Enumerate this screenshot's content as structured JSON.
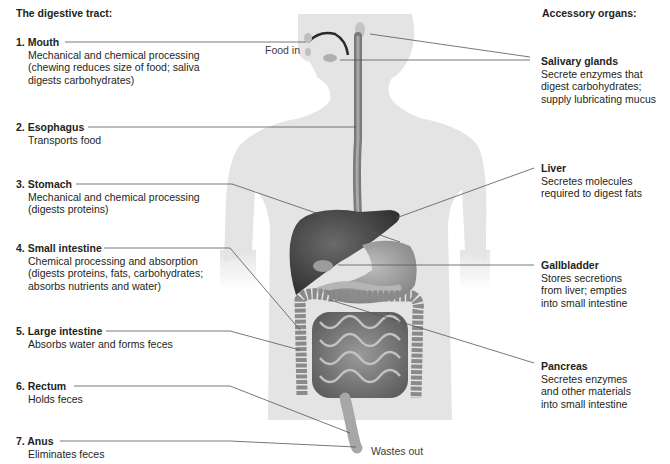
{
  "diagram": {
    "left_heading": "The digestive tract:",
    "right_heading": "Accessory organs:",
    "tract": [
      {
        "number": "1.",
        "name": "Mouth",
        "title": "1. Mouth",
        "description": "Mechanical and chemical processing\n(chewing reduces size of food; saliva\ndigests carbohydrates)"
      },
      {
        "number": "2.",
        "name": "Esophagus",
        "title": "2. Esophagus",
        "description": "Transports food"
      },
      {
        "number": "3.",
        "name": "Stomach",
        "title": "3. Stomach",
        "description": "Mechanical and chemical processing\n(digests proteins)"
      },
      {
        "number": "4.",
        "name": "Small intestine",
        "title": "4. Small intestine",
        "description": "Chemical processing and absorption\n(digests proteins, fats, carbohydrates;\nabsorbs nutrients and water)"
      },
      {
        "number": "5.",
        "name": "Large intestine",
        "title": "5. Large intestine",
        "description": "Absorbs water and forms feces"
      },
      {
        "number": "6.",
        "name": "Rectum",
        "title": "6. Rectum",
        "description": "Holds feces"
      },
      {
        "number": "7.",
        "name": "Anus",
        "title": "7. Anus",
        "description": "Eliminates feces"
      }
    ],
    "accessory": [
      {
        "name": "Salivary glands",
        "description": "Secrete enzymes that\ndigest carbohydrates;\nsupply lubricating mucus"
      },
      {
        "name": "Liver",
        "description": "Secretes molecules\nrequired to digest fats"
      },
      {
        "name": "Gallbladder",
        "description": "Stores secretions\nfrom liver; empties\ninto small intestine"
      },
      {
        "name": "Pancreas",
        "description": "Secretes enzymes\nand other materials\ninto small intestine"
      }
    ],
    "annotations": {
      "food_in": "Food in",
      "wastes_out": "Wastes out"
    },
    "colors": {
      "silhouette": "#e4e4e4",
      "organ_dark": "#4a4a4a",
      "organ_mid": "#8c8c8c",
      "organ_light": "#b4b4b4",
      "leader_line": "#555555",
      "text": "#231f20"
    }
  }
}
